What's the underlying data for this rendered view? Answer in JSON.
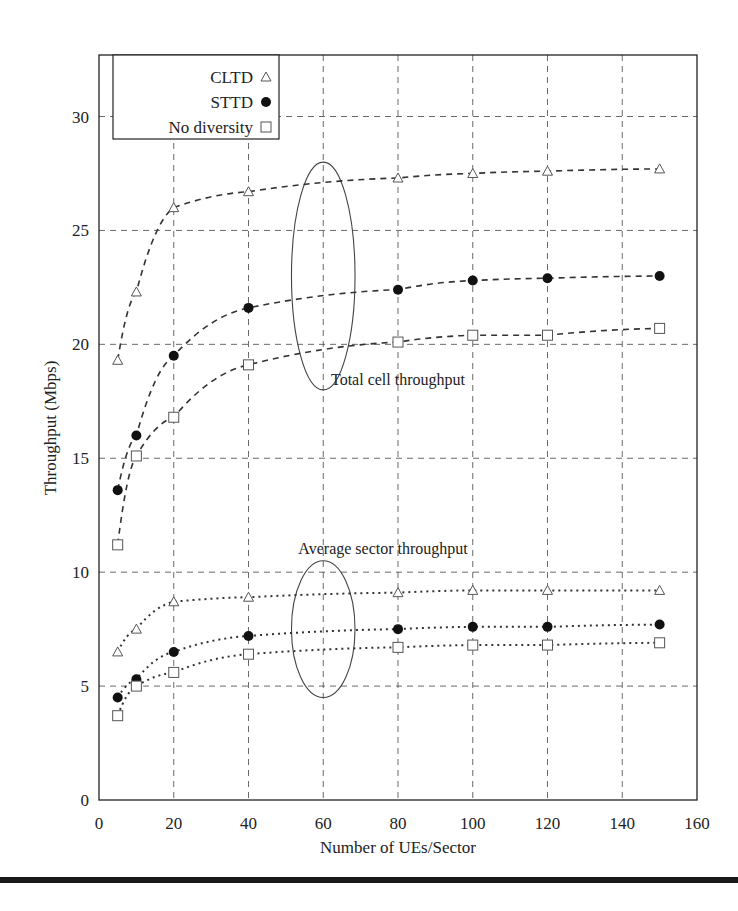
{
  "chart_data": {
    "type": "line",
    "title": "",
    "xlabel": "Number of UEs/Sector",
    "ylabel": "Throughput (Mbps)",
    "xlim": [
      0,
      160
    ],
    "ylim": [
      0,
      32.7
    ],
    "xticks": [
      0,
      20,
      40,
      60,
      80,
      100,
      120,
      140,
      160
    ],
    "yticks": [
      0,
      5,
      10,
      15,
      20,
      25,
      30
    ],
    "grid": true,
    "legend_position": "upper left",
    "x": [
      5,
      10,
      20,
      40,
      80,
      100,
      120,
      150
    ],
    "series": [
      {
        "name": "CLTD",
        "group": "Total cell throughput",
        "marker": "triangle",
        "style": "dashed",
        "values": [
          19.3,
          22.3,
          26.0,
          26.7,
          27.3,
          27.5,
          27.6,
          27.7
        ]
      },
      {
        "name": "STTD",
        "group": "Total cell throughput",
        "marker": "circle",
        "style": "dashed",
        "values": [
          13.6,
          16.0,
          19.5,
          21.6,
          22.4,
          22.8,
          22.9,
          23.0
        ]
      },
      {
        "name": "No diversity",
        "group": "Total cell throughput",
        "marker": "square",
        "style": "dashed",
        "values": [
          11.2,
          15.1,
          16.8,
          19.1,
          20.1,
          20.4,
          20.4,
          20.7
        ]
      },
      {
        "name": "CLTD",
        "group": "Average sector throughput",
        "marker": "triangle",
        "style": "dotted",
        "values": [
          6.5,
          7.5,
          8.7,
          8.9,
          9.1,
          9.2,
          9.2,
          9.2
        ]
      },
      {
        "name": "STTD",
        "group": "Average sector throughput",
        "marker": "circle",
        "style": "dotted",
        "values": [
          4.5,
          5.3,
          6.5,
          7.2,
          7.5,
          7.6,
          7.6,
          7.7
        ]
      },
      {
        "name": "No diversity",
        "group": "Average sector throughput",
        "marker": "square",
        "style": "dotted",
        "values": [
          3.7,
          5.0,
          5.6,
          6.4,
          6.7,
          6.8,
          6.8,
          6.9
        ]
      }
    ],
    "legend": [
      "CLTD",
      "STTD",
      "No diversity"
    ],
    "annotations": [
      {
        "text": "Total cell throughput",
        "x": 80,
        "y": 18.2,
        "ellipse": {
          "cx": 60,
          "cy": 23,
          "rx": 8.5,
          "ry": 5
        }
      },
      {
        "text": "Average sector throughput",
        "x": 76,
        "y": 10.8,
        "ellipse": {
          "cx": 60,
          "cy": 7.5,
          "rx": 8.5,
          "ry": 3
        }
      }
    ]
  }
}
